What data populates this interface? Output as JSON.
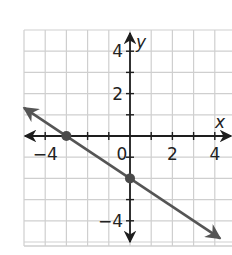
{
  "chart_data": {
    "type": "line",
    "title": "",
    "xlabel": "x",
    "ylabel": "y",
    "xlim": [
      -5,
      5
    ],
    "ylim": [
      -5,
      5
    ],
    "grid": true,
    "grid_step": 1,
    "x_tick_labels": [
      {
        "value": -4,
        "text": "−4"
      },
      {
        "value": 0,
        "text": "0"
      },
      {
        "value": 2,
        "text": "2"
      },
      {
        "value": 4,
        "text": "4"
      }
    ],
    "y_tick_labels": [
      {
        "value": 4,
        "text": "4"
      },
      {
        "value": 2,
        "text": "2"
      },
      {
        "value": -4,
        "text": "−4"
      }
    ],
    "series": [
      {
        "name": "line",
        "equation": "y = -2/3 x - 2",
        "slope": -0.6667,
        "intercept": -2,
        "x": [
          -5,
          4.25
        ],
        "y": [
          1.33,
          -4.83
        ],
        "arrows_both_ends": true,
        "color": "#555555"
      }
    ],
    "points": [
      {
        "label": "x-intercept",
        "x": -3,
        "y": 0
      },
      {
        "label": "y-intercept",
        "x": 0,
        "y": -2
      }
    ],
    "legend": null
  },
  "colors": {
    "grid": "#cfcfcf",
    "axis": "#1e1e1e",
    "line": "#555555",
    "point": "#4a4a4a"
  }
}
